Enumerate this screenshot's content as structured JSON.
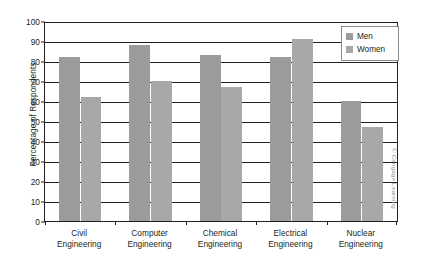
{
  "chart_data": {
    "type": "bar",
    "title": "",
    "xlabel": "",
    "ylabel": "Percentage of Respondents",
    "ylim": [
      0,
      100
    ],
    "ytick_step": 10,
    "yticks": [
      0,
      10,
      20,
      30,
      40,
      50,
      60,
      70,
      80,
      90,
      100
    ],
    "grid": true,
    "legend_position": "top-right",
    "categories": [
      "Civil Engineering",
      "Computer Engineering",
      "Chemical Engineering",
      "Electrical Engineering",
      "Nuclear Engineering"
    ],
    "category_lines": [
      [
        "Civil",
        "Engineering"
      ],
      [
        "Computer",
        "Engineering"
      ],
      [
        "Chemical",
        "Engineering"
      ],
      [
        "Electrical",
        "Engineering"
      ],
      [
        "Nuclear",
        "Engineering"
      ]
    ],
    "series": [
      {
        "name": "Men",
        "color": "#9b9b9b",
        "values": [
          82,
          88,
          83,
          82,
          60
        ]
      },
      {
        "name": "Women",
        "color": "#a8a8a8",
        "values": [
          62,
          70,
          67,
          91,
          47
        ]
      }
    ]
  },
  "legend": {
    "items": [
      {
        "label": "Men",
        "color": "#9b9b9b"
      },
      {
        "label": "Women",
        "color": "#a8a8a8"
      }
    ]
  },
  "credit": {
    "text": "© Cengage Learning"
  }
}
